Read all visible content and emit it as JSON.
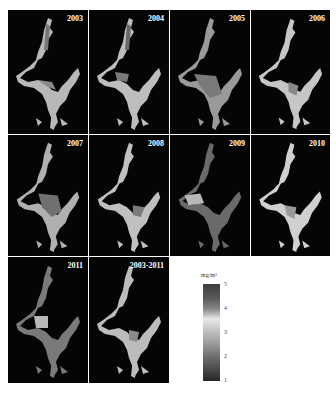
{
  "figure": {
    "panels": [
      {
        "label": "2003"
      },
      {
        "label": "2004"
      },
      {
        "label": "2005"
      },
      {
        "label": "2006"
      },
      {
        "label": "2007"
      },
      {
        "label": "2008"
      },
      {
        "label": "2009"
      },
      {
        "label": "2010"
      },
      {
        "label": "2011"
      },
      {
        "label": "2003-2011"
      }
    ],
    "colorbar": {
      "unit": "mg/m³",
      "ticks": [
        "5",
        "4",
        "3",
        "2",
        "1"
      ],
      "range": [
        1,
        5
      ]
    }
  }
}
